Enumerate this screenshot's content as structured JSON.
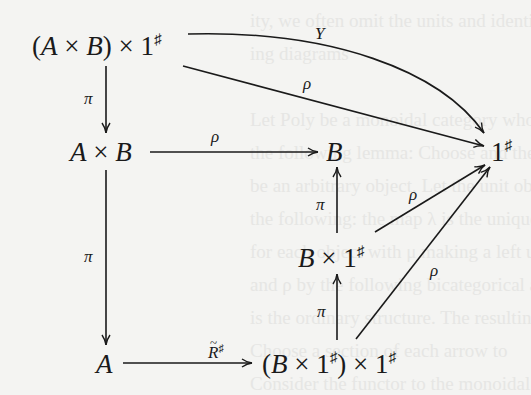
{
  "nodes": {
    "top_left": {
      "prefix": "(",
      "a": "A",
      "times1": " × ",
      "b": "B",
      "suffix": ") × 1",
      "sup": "♯"
    },
    "mid_left": {
      "a": "A",
      "times": " × ",
      "b": "B"
    },
    "mid_center": {
      "b": "B"
    },
    "right": {
      "one": "1",
      "sup": "♯"
    },
    "center_low": {
      "b": "B",
      "times": " × 1",
      "sup": "♯"
    },
    "bottom_left": {
      "a": "A"
    },
    "bottom_center": {
      "prefix": "(",
      "b": "B",
      "times": " × 1",
      "sup1": "♯",
      "mid": ") × 1",
      "sup2": "♯"
    }
  },
  "arrows": {
    "Y": {
      "label": "Y",
      "from": "(A × B) × 1♯",
      "to": "1♯",
      "style": "curved"
    },
    "rho_top": {
      "label": "ρ",
      "from": "(A × B) × 1♯",
      "to": "1♯"
    },
    "pi_top": {
      "label": "π",
      "from": "(A × B) × 1♯",
      "to": "A × B"
    },
    "rho_mid": {
      "label": "ρ",
      "from": "A × B",
      "to": "B"
    },
    "pi_left": {
      "label": "π",
      "from": "A × B",
      "to": "A"
    },
    "pi_up_mid": {
      "label": "π",
      "from": "B × 1♯",
      "to": "B"
    },
    "rho_center": {
      "label": "ρ",
      "from": "B × 1♯",
      "to": "1♯"
    },
    "pi_up_low": {
      "label": "π",
      "from": "(B × 1♯) × 1♯",
      "to": "B × 1♯"
    },
    "rho_low": {
      "label": "ρ",
      "from": "(B × 1♯) × 1♯",
      "to": "1♯"
    },
    "R_bottom": {
      "label": "R",
      "sup": "♯",
      "from": "A",
      "to": "(B × 1♯) × 1♯",
      "accent": "tilde"
    }
  },
  "background_text": [
    "ity, we often omit the units and identities in our",
    "ing diagrams",
    "",
    "Let Poly be a monoidal category whose",
    "the following lemma: Choose and the tensor produc",
    "be an arbitrary object, Let the unit object",
    "the following: the map λ is the unique natural",
    "for each object with μ making a left unit",
    "and ρ by the following bicategorical axioms",
    "is the ordinary structure. The resulting",
    "Choose a section of each arrow to",
    "Consider the functor to the monoidal maps",
    "is a monoidal morphism that is natural"
  ]
}
